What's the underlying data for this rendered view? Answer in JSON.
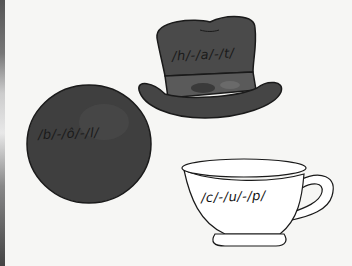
{
  "worksheet": {
    "items": [
      {
        "name": "hat",
        "sound_label": "/h/-/a/-/t/"
      },
      {
        "name": "ball",
        "sound_label": "/b/-/ô/-/l/"
      },
      {
        "name": "cup",
        "sound_label": "/c/-/u/-/p/"
      }
    ]
  },
  "colors": {
    "background": "#f6f6f4",
    "hat_fill": "#4a4a4a",
    "ball_fill": "#3f3f3f",
    "cup_fill": "#ffffff",
    "outline": "#1a1a1a"
  }
}
